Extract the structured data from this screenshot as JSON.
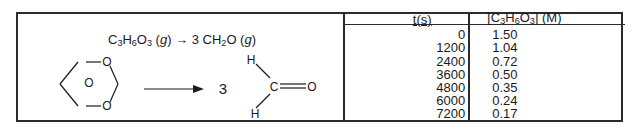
{
  "reaction": {
    "reactant_formula": "C3H6O3",
    "reactant_state": "g",
    "arrow": "→",
    "product_coefficient": "3",
    "product_formula": "CH2O",
    "product_state": "g",
    "structure_labels": {
      "trioxane_atoms": [
        "O",
        "O",
        "O"
      ],
      "coefficient": "3",
      "formaldehyde_atoms": [
        "H",
        "H",
        "C",
        "O"
      ]
    }
  },
  "table": {
    "headers": {
      "time": "t(s)",
      "concentration": "[C3H6O3] (M)"
    },
    "rows": [
      {
        "t": "0",
        "conc": "1.50"
      },
      {
        "t": "1200",
        "conc": "1.04"
      },
      {
        "t": "2400",
        "conc": "0.72"
      },
      {
        "t": "3600",
        "conc": "0.50"
      },
      {
        "t": "4800",
        "conc": "0.35"
      },
      {
        "t": "6000",
        "conc": "0.24"
      },
      {
        "t": "7200",
        "conc": "0.17"
      }
    ]
  }
}
